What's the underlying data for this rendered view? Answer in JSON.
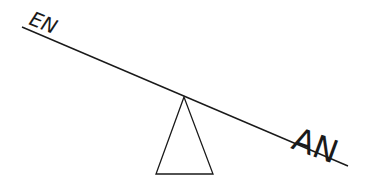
{
  "diagram": {
    "type": "seesaw",
    "labels": {
      "left": "EN",
      "right": "AN"
    },
    "colors": {
      "stroke": "#1a1a1a",
      "background": "#ffffff"
    }
  }
}
